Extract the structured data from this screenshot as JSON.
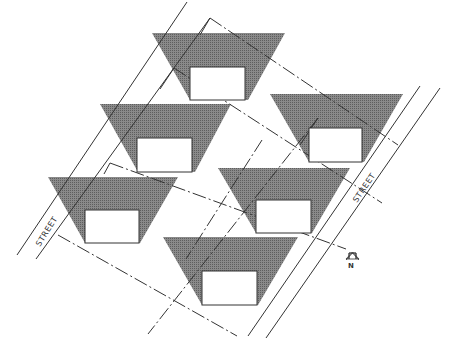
{
  "diagram": {
    "type": "site-plan",
    "colors": {
      "shade": "#777777",
      "line": "#333333",
      "house": "#ffffff",
      "background": "#ffffff"
    },
    "labels": {
      "street_left": "STREET",
      "street_right": "STREET",
      "north": "N"
    },
    "lots": [
      {
        "id": 1,
        "name": "top"
      },
      {
        "id": 2,
        "name": "middle-left"
      },
      {
        "id": 3,
        "name": "middle-right"
      },
      {
        "id": 4,
        "name": "lower-left"
      },
      {
        "id": 5,
        "name": "center-right"
      },
      {
        "id": 6,
        "name": "bottom"
      }
    ]
  }
}
